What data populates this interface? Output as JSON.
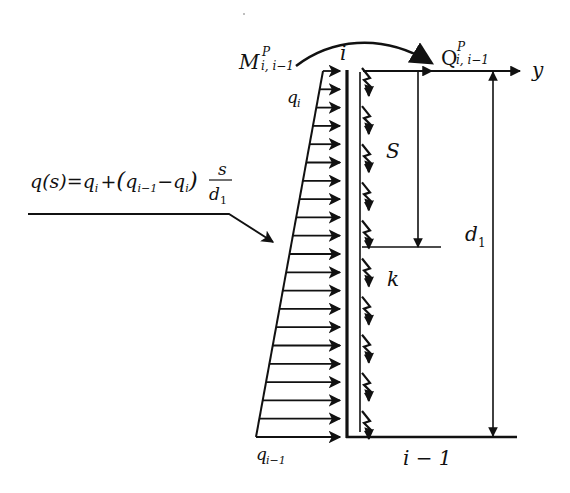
{
  "diagram": {
    "type": "structural-mechanics",
    "labels": {
      "moment": "M",
      "moment_sup": "P",
      "moment_sub": "i, i−1",
      "shear": "Q",
      "shear_sup": "P",
      "shear_sub": "i, i−1",
      "node_top": "i",
      "node_bottom": "i − 1",
      "axis": "y",
      "load_top": "q",
      "load_top_sub": "i",
      "load_bottom": "q",
      "load_bottom_sub": "i−1",
      "s_dim": "S",
      "spring": "k",
      "d_dim": "d",
      "d_dim_sub": "1"
    },
    "formula": {
      "lhs": "q(s)",
      "eq": "=",
      "part1": "q",
      "part1_sub": "i",
      "plus": "+",
      "open": "(",
      "part2": "q",
      "part2_sub": "i−1",
      "minus": "−",
      "part3": "q",
      "part3_sub": "i",
      "close": ")",
      "frac_num": "s",
      "frac_den": "d",
      "frac_den_sub": "1"
    },
    "load_arrow_count": 21,
    "spring_count": 10,
    "colors": {
      "ink": "#111111",
      "background": "#ffffff"
    }
  }
}
